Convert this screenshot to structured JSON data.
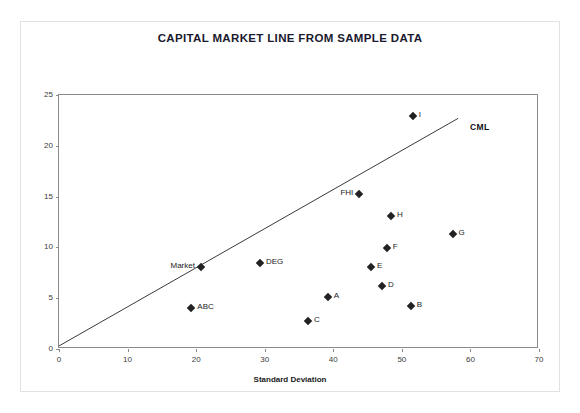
{
  "chart_data": {
    "type": "scatter",
    "title": "CAPITAL MARKET LINE FROM SAMPLE DATA",
    "xlabel": "Standard Deviation",
    "ylabel": "Average Return",
    "xlim": [
      0,
      70
    ],
    "ylim": [
      0,
      25
    ],
    "xticks": [
      0,
      10,
      20,
      30,
      40,
      50,
      60,
      70
    ],
    "yticks": [
      0,
      5,
      10,
      15,
      20,
      25
    ],
    "grid": false,
    "legend": "none",
    "points": [
      {
        "label": "Market",
        "x": 20.7,
        "y": 8.1,
        "label_side": "left"
      },
      {
        "label": "ABC",
        "x": 19.3,
        "y": 4.0,
        "label_side": "right"
      },
      {
        "label": "DEG",
        "x": 29.3,
        "y": 8.5,
        "label_side": "right"
      },
      {
        "label": "C",
        "x": 36.3,
        "y": 2.75,
        "label_side": "right"
      },
      {
        "label": "A",
        "x": 39.2,
        "y": 5.1,
        "label_side": "right"
      },
      {
        "label": "FHI",
        "x": 43.8,
        "y": 15.3,
        "label_side": "left"
      },
      {
        "label": "E",
        "x": 45.5,
        "y": 8.1,
        "label_side": "right"
      },
      {
        "label": "D",
        "x": 47.1,
        "y": 6.2,
        "label_side": "right"
      },
      {
        "label": "F",
        "x": 47.8,
        "y": 9.9,
        "label_side": "right"
      },
      {
        "label": "H",
        "x": 48.4,
        "y": 13.1,
        "label_side": "right"
      },
      {
        "label": "B",
        "x": 51.3,
        "y": 4.2,
        "label_side": "right"
      },
      {
        "label": "I",
        "x": 51.6,
        "y": 22.9,
        "label_side": "right"
      },
      {
        "label": "G",
        "x": 57.4,
        "y": 11.3,
        "label_side": "right"
      }
    ],
    "line": {
      "name": "CML",
      "label": "CML",
      "x": [
        0,
        58.2
      ],
      "y": [
        0.3,
        22.7
      ],
      "color": "#3a3a3a"
    }
  },
  "colors": {
    "marker": "#222222",
    "axis": "#8a8a8a",
    "text": "#1a1a1a",
    "frame": "#e2e2e2"
  }
}
